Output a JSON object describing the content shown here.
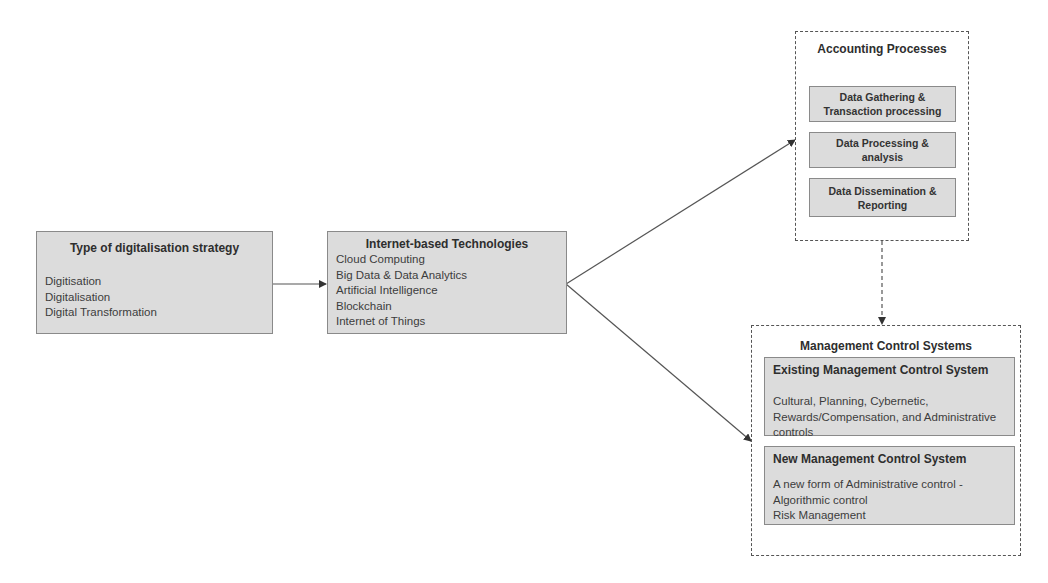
{
  "diagram": {
    "strategy_box": {
      "title": "Type of digitalisation strategy",
      "items": [
        "Digitisation",
        "Digitalisation",
        "Digital Transformation"
      ]
    },
    "technologies_box": {
      "title": "Internet-based Technologies",
      "items": [
        "Cloud Computing",
        "Big Data & Data Analytics",
        "Artificial Intelligence",
        "Blockchain",
        "Internet of Things"
      ]
    },
    "accounting_box": {
      "title": "Accounting Processes",
      "steps": [
        {
          "line1": "Data Gathering &",
          "line2": "Transaction processing"
        },
        {
          "line1": "Data Processing &",
          "line2": "analysis"
        },
        {
          "line1": "Data Dissemination &",
          "line2": "Reporting"
        }
      ]
    },
    "mcs_box": {
      "title": "Management Control Systems",
      "existing": {
        "title": "Existing Management Control System",
        "lines": [
          "Cultural, Planning, Cybernetic,",
          "Rewards/Compensation, and Administrative",
          "controls"
        ]
      },
      "new": {
        "title": "New Management Control System",
        "lines": [
          "A new form of Administrative control -",
          "Algorithmic control",
          "Risk Management"
        ]
      }
    },
    "colors": {
      "box_fill": "#dcdcdc",
      "box_border": "#8a8a8a",
      "dashed_border": "#555555",
      "arrow": "#444444",
      "text": "#333333"
    }
  }
}
